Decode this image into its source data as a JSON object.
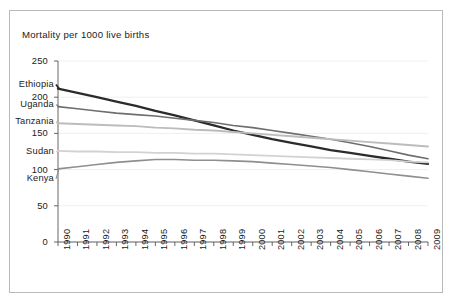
{
  "chart_data": {
    "type": "line",
    "title": "Mortality per 1000 live births",
    "xlabel": "",
    "ylabel": "",
    "ylim": [
      0,
      250
    ],
    "yticks": [
      0,
      50,
      100,
      150,
      200,
      250
    ],
    "grid": true,
    "legend_position": "inline-left-labels",
    "x": [
      1990,
      1991,
      1992,
      1993,
      1994,
      1995,
      1996,
      1997,
      1998,
      1999,
      2000,
      2001,
      2002,
      2003,
      2004,
      2005,
      2006,
      2007,
      2008,
      2009
    ],
    "categories": [
      "1990",
      "1991",
      "1992",
      "1993",
      "1994",
      "1995",
      "1996",
      "1997",
      "1998",
      "1999",
      "2000",
      "2001",
      "2002",
      "2003",
      "2004",
      "2005",
      "2006",
      "2007",
      "2008",
      "2009"
    ],
    "series": [
      {
        "name": "Ethiopia",
        "color": "#2b2b2b",
        "width": 2.3,
        "values": [
          212,
          206,
          200,
          194,
          188,
          181,
          175,
          168,
          161,
          154,
          148,
          142,
          137,
          132,
          127,
          123,
          119,
          115,
          111,
          108
        ]
      },
      {
        "name": "Uganda",
        "color": "#6e6e6e",
        "width": 1.6,
        "values": [
          187,
          184,
          181,
          178,
          176,
          174,
          171,
          168,
          165,
          161,
          158,
          154,
          150,
          146,
          142,
          137,
          132,
          126,
          120,
          115
        ]
      },
      {
        "name": "Tanzania",
        "color": "#bcbcbc",
        "width": 1.9,
        "values": [
          164,
          163,
          162,
          161,
          160,
          158,
          157,
          155,
          154,
          152,
          150,
          148,
          146,
          144,
          142,
          140,
          138,
          136,
          134,
          132
        ]
      },
      {
        "name": "Sudan",
        "color": "#d2d2d2",
        "width": 1.8,
        "values": [
          126,
          125,
          125,
          124,
          124,
          123,
          123,
          122,
          122,
          121,
          120,
          119,
          118,
          117,
          116,
          115,
          114,
          113,
          111,
          110
        ]
      },
      {
        "name": "Kenya",
        "color": "#8f8f8f",
        "width": 1.6,
        "values": [
          101,
          104,
          107,
          110,
          112,
          114,
          114,
          113,
          113,
          112,
          111,
          109,
          107,
          105,
          103,
          100,
          97,
          94,
          91,
          88
        ]
      }
    ]
  },
  "labels": {
    "series_names": [
      "Ethiopia",
      "Uganda",
      "Tanzania",
      "Sudan",
      "Kenya"
    ]
  }
}
